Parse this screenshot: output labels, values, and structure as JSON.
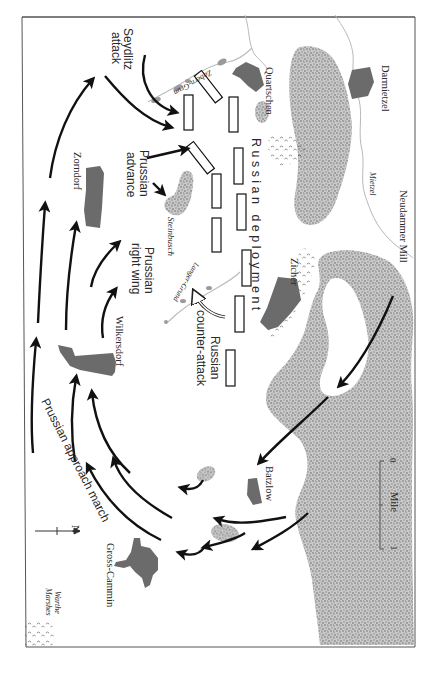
{
  "map": {
    "title": "Battle of Zorndorf",
    "orientation": "rotated 90° clockwise",
    "colors": {
      "frame": "#555555",
      "stipple": "#9a9a9a",
      "village": "#6b6b6b",
      "arrow": "#111111",
      "river": "#bdbdbd",
      "marsh": "#8a8a8a"
    }
  },
  "labels": {
    "seydlitz": [
      "Seydlitz",
      "attack"
    ],
    "prussian_advance": [
      "Prussian",
      "advance"
    ],
    "prussian_right_wing": [
      "Prussian",
      "right wing"
    ],
    "prussian_approach": "Prussian approach march",
    "russian_deployment": "R u s s i a n   d e p l o y m e n t",
    "russian_counter": [
      "Russian",
      "counter-attack"
    ]
  },
  "places": {
    "zabern_grund": "Zabern-Grun",
    "quartschen": "Quartschen",
    "darmietzel": "Darmietzel",
    "mietzel": "Mietzel",
    "neudammer_mill": "Neudammer Mill",
    "zorndorf": "Zorndorf",
    "steinbusch": "Steinbusch",
    "langer_grund": "Langer-Grund",
    "zicher": "Zicher",
    "wilkersdorf": "Wilkersdorf",
    "batzlow": "Batzlow",
    "gross_cammin": "Gross-Cammin",
    "warthe_marshes": [
      "Warthe",
      "Marshes"
    ]
  },
  "scale": {
    "label": "Mile",
    "start": "0",
    "end": "1"
  },
  "north": {
    "label": "N"
  }
}
